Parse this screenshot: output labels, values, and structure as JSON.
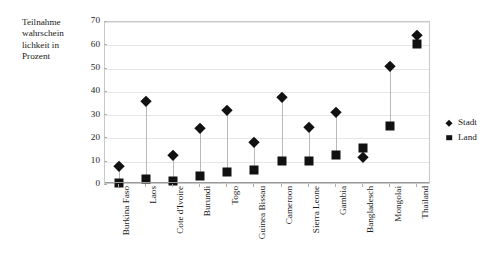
{
  "chart_data": {
    "type": "scatter",
    "title": "",
    "subtitle": "",
    "xlabel": "",
    "ylabel": "Teilnahme\nwahrschein\nlichkeit in\nProzent",
    "ylim": [
      0,
      70
    ],
    "ytick_labels": [
      "0",
      "10",
      "20",
      "30",
      "40",
      "50",
      "60",
      "70"
    ],
    "ytick_values": [
      0,
      10,
      20,
      30,
      40,
      50,
      60,
      70
    ],
    "grid": true,
    "grid_axis": "y",
    "legend_position": "right",
    "categories": [
      "Burkina Faso",
      "Laos",
      "Cote d'Ivoire",
      "Burundi",
      "Togo",
      "Guinea Bissau",
      "Cameroon",
      "Sierra Leone",
      "Gambia",
      "Bangladesch",
      "Mongolai",
      "Thailand"
    ],
    "series": [
      {
        "name": "Stadt",
        "marker": "diamond",
        "color": "#111111",
        "values": [
          8,
          36,
          13,
          24.5,
          32,
          18.5,
          38,
          25,
          31.5,
          12,
          51,
          64.5
        ]
      },
      {
        "name": "Land",
        "marker": "square",
        "color": "#111111",
        "values": [
          1,
          2.5,
          1.8,
          4,
          5.5,
          6.5,
          10.5,
          10.5,
          13,
          16,
          25.5,
          60.5
        ]
      }
    ]
  },
  "legend": {
    "entries": [
      {
        "label": "Stadt",
        "marker": "diamond"
      },
      {
        "label": "Land",
        "marker": "square"
      }
    ]
  }
}
